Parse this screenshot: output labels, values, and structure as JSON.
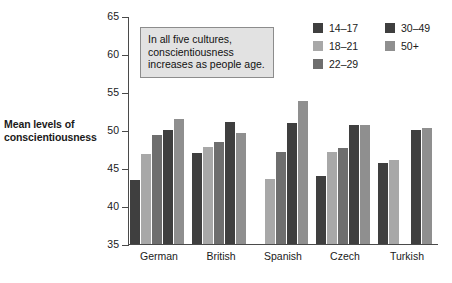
{
  "chart_data": {
    "type": "bar",
    "title": "",
    "subtitle": "",
    "xlabel": "",
    "ylabel": "Mean levels of conscientiousness",
    "ylim": [
      35,
      65
    ],
    "ytick_step": 5,
    "yticks": [
      35,
      40,
      45,
      50,
      55,
      60,
      65
    ],
    "grid": false,
    "legend_position": "top-right",
    "categories": [
      "German",
      "British",
      "Spanish",
      "Czech",
      "Turkish"
    ],
    "series": [
      {
        "name": "14–17",
        "color": "#3f3f3f",
        "values": [
          43.4,
          47.0,
          null,
          44.0,
          45.7
        ]
      },
      {
        "name": "18–21",
        "color": "#a8a8a8",
        "values": [
          46.9,
          47.8,
          43.5,
          47.1,
          46.0
        ]
      },
      {
        "name": "22–29",
        "color": "#6e6e6e",
        "values": [
          49.4,
          48.4,
          47.1,
          47.6,
          null
        ]
      },
      {
        "name": "30–49",
        "color": "#3f3f3f",
        "values": [
          50.0,
          51.0,
          50.9,
          50.7,
          50.0
        ]
      },
      {
        "name": "50+",
        "color": "#8f8f8f",
        "values": [
          51.5,
          49.6,
          53.8,
          50.7,
          50.3
        ]
      }
    ],
    "annotation": {
      "text": "In all five cultures, conscientiousness increases as people age.",
      "background": "#e2e2e2",
      "border": "#8c8c8c"
    },
    "axis_color": "#4a4a4a",
    "background": "#ffffff"
  },
  "y_axis": {
    "title_line1": "Mean levels of",
    "title_line2": "conscientiousness"
  },
  "legend": {
    "columns": [
      {
        "items": [
          {
            "label": "14–17",
            "color": "#3f3f3f",
            "name": "legend-item-14-17"
          },
          {
            "label": "18–21",
            "color": "#a8a8a8",
            "name": "legend-item-18-21"
          },
          {
            "label": "22–29",
            "color": "#6e6e6e",
            "name": "legend-item-22-29"
          }
        ]
      },
      {
        "items": [
          {
            "label": "30–49",
            "color": "#3f3f3f",
            "name": "legend-item-30-49"
          },
          {
            "label": "50+",
            "color": "#8f8f8f",
            "name": "legend-item-50-plus"
          }
        ]
      }
    ]
  }
}
